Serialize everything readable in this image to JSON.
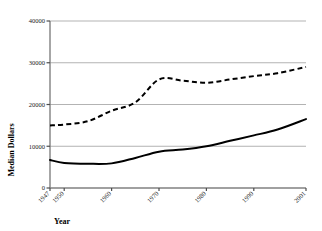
{
  "chart_data": {
    "type": "line",
    "title": "",
    "subtitle": "",
    "xlabel": "Year",
    "ylabel": "Median Dollars",
    "grid": true,
    "grid_axis": "y",
    "legend": "none",
    "xlim": [
      1947,
      2001
    ],
    "ylim": [
      0,
      40000
    ],
    "ytick_labels": [
      "0",
      "10000",
      "20000",
      "30000",
      "40000"
    ],
    "ytick_values": [
      0,
      10000,
      20000,
      30000,
      40000
    ],
    "xtick_labels": [
      "1947",
      "1950",
      "1960",
      "1970",
      "1980",
      "1990",
      "2001"
    ],
    "xtick_values": [
      1947,
      1950,
      1960,
      1970,
      1980,
      1990,
      2001
    ],
    "x": [
      1947,
      1950,
      1955,
      1960,
      1965,
      1970,
      1975,
      1980,
      1985,
      1990,
      1995,
      2001
    ],
    "series": [
      {
        "name": "upper-dashed-series",
        "style": "dashed",
        "color": "#000000",
        "values": [
          15000,
          15200,
          16000,
          18500,
          20500,
          26000,
          25700,
          25200,
          26000,
          26800,
          27500,
          29000
        ]
      },
      {
        "name": "lower-solid-series",
        "style": "solid",
        "color": "#000000",
        "values": [
          6700,
          6000,
          5800,
          5900,
          7200,
          8700,
          9200,
          10000,
          11300,
          12600,
          14000,
          16500
        ]
      }
    ],
    "colors": {
      "gridline": "#b3b3b3",
      "axis": "#808080",
      "line": "#000000",
      "background": "#ffffff",
      "text": "#1a1a1a"
    }
  }
}
